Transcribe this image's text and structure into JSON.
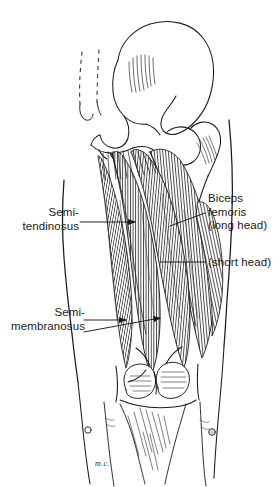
{
  "figure": {
    "background_color": "#ffffff",
    "ink_color": "#1a1a1a",
    "signature": "m.c."
  },
  "labels": {
    "semitendinosus": {
      "line1": "Semi-",
      "line2": "tendinosus",
      "align": "right"
    },
    "semimembranosus": {
      "line1": "Semi-",
      "line2": "membranosus",
      "align": "right"
    },
    "biceps_femoris": {
      "line1": "Biceps",
      "line2": "femoris",
      "line3": "(long head)",
      "align": "left"
    },
    "biceps_short_head": {
      "line1": "(short head)",
      "align": "left"
    }
  },
  "structures": [
    {
      "name": "ilium",
      "region": "pelvis"
    },
    {
      "name": "sacrum",
      "region": "pelvis"
    },
    {
      "name": "ischial-tuberosity",
      "region": "pelvis"
    },
    {
      "name": "femur-head",
      "region": "hip"
    },
    {
      "name": "greater-trochanter",
      "region": "hip"
    },
    {
      "name": "femur-shaft",
      "region": "thigh"
    },
    {
      "name": "semitendinosus-muscle",
      "region": "thigh"
    },
    {
      "name": "semimembranosus-muscle",
      "region": "thigh"
    },
    {
      "name": "biceps-femoris-long-head-muscle",
      "region": "thigh"
    },
    {
      "name": "biceps-femoris-short-head-muscle",
      "region": "thigh"
    },
    {
      "name": "femoral-condyles",
      "region": "knee"
    },
    {
      "name": "popliteal-fossa",
      "region": "knee"
    },
    {
      "name": "gastrocnemius-heads",
      "region": "calf"
    }
  ]
}
